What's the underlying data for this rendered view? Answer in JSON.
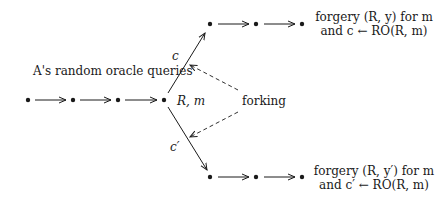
{
  "diagram": {
    "title_label": "A's random oracle queries",
    "fork_point_label": "R, m",
    "fork_label": "forking",
    "branch_top_edge_label": "c",
    "branch_bottom_edge_label": "c′",
    "top_outcome": {
      "line1": "forgery (R, y) for m",
      "line2": "and c ← RO(R, m)"
    },
    "bottom_outcome": {
      "line1": "forgery (R, y′) for m",
      "line2": "and c′ ← RO(R, m)"
    },
    "nodes_main_chain": 4,
    "nodes_top_branch": 3,
    "nodes_bottom_branch": 3,
    "colors": {
      "ink": "#1a1a1a",
      "background": "#ffffff"
    }
  }
}
